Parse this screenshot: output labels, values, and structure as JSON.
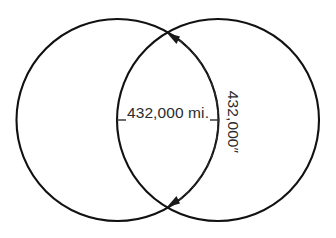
{
  "figure": {
    "background_color": "#ffffff",
    "stroke_color": "#111111",
    "text_color": "#2c2c2c",
    "width": 336,
    "height": 238
  },
  "labels": {
    "diameter": "432,000 mi.",
    "arc": "432,000″"
  },
  "geometry": {
    "left_circle": {
      "cx": 117.5,
      "cy": 120,
      "r": 101
    },
    "right_circle": {
      "cx": 218,
      "cy": 120,
      "r": 101
    },
    "diameter_line": {
      "x1": 117,
      "y1": 120,
      "x2": 218,
      "y2": 120
    },
    "intersection_top": {
      "x": 167.5,
      "y": 32
    },
    "intersection_bottom": {
      "x": 167.5,
      "y": 208
    }
  },
  "annotations": {
    "arc_arrow_style": "double-headed-dashed",
    "arc_label_rotation_deg": 90
  }
}
